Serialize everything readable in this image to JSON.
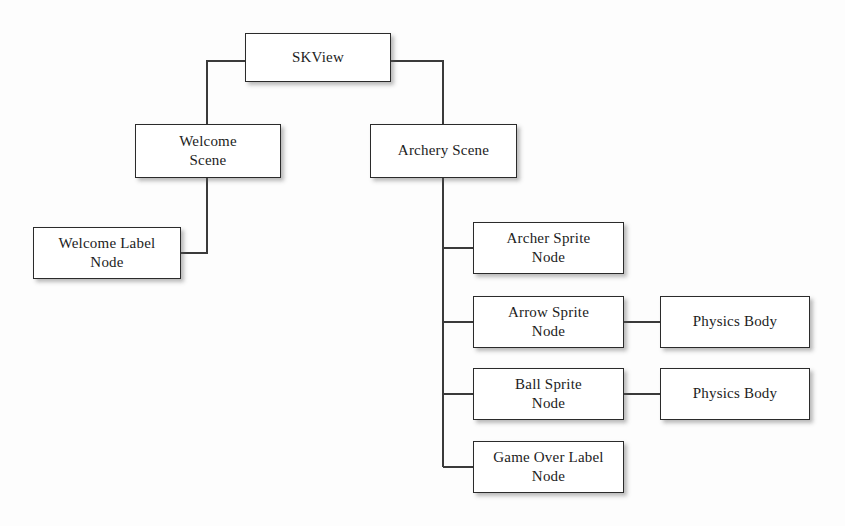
{
  "diagram": {
    "type": "tree-diagram",
    "colors": {
      "background": "#fdfdfd",
      "box_fill": "#ffffff",
      "box_border": "#2b2b2b",
      "connector": "#3a3a3a",
      "text": "#1c1c1c"
    },
    "nodes": {
      "skview": "SKView",
      "welcome_scene": "Welcome\nScene",
      "welcome_label_node": "Welcome Label\nNode",
      "archery_scene": "Archery Scene",
      "archer_sprite_node": "Archer Sprite\nNode",
      "arrow_sprite_node": "Arrow Sprite\nNode",
      "ball_sprite_node": "Ball Sprite\nNode",
      "game_over_label_node": "Game Over Label\nNode",
      "physics_body_arrow": "Physics Body",
      "physics_body_ball": "Physics Body"
    },
    "edges": [
      {
        "from": "skview",
        "to": "welcome_scene"
      },
      {
        "from": "skview",
        "to": "archery_scene"
      },
      {
        "from": "welcome_scene",
        "to": "welcome_label_node"
      },
      {
        "from": "archery_scene",
        "to": "archer_sprite_node"
      },
      {
        "from": "archery_scene",
        "to": "arrow_sprite_node"
      },
      {
        "from": "archery_scene",
        "to": "ball_sprite_node"
      },
      {
        "from": "archery_scene",
        "to": "game_over_label_node"
      },
      {
        "from": "arrow_sprite_node",
        "to": "physics_body_arrow"
      },
      {
        "from": "ball_sprite_node",
        "to": "physics_body_ball"
      }
    ]
  }
}
